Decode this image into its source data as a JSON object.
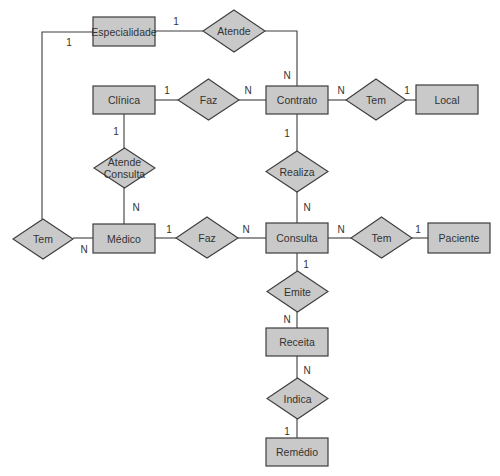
{
  "diagram": {
    "type": "entity-relationship",
    "colors": {
      "fill": "#c9c9c9",
      "stroke": "#3c3c3c",
      "text": "#333333",
      "background": "#ffffff"
    },
    "entities": [
      {
        "id": "especialidade",
        "label": "Especialidade"
      },
      {
        "id": "clinica",
        "label": "Clínica"
      },
      {
        "id": "contrato",
        "label": "Contrato"
      },
      {
        "id": "local",
        "label": "Local"
      },
      {
        "id": "medico",
        "label": "Médico"
      },
      {
        "id": "consulta",
        "label": "Consulta"
      },
      {
        "id": "paciente",
        "label": "Paciente"
      },
      {
        "id": "receita",
        "label": "Receita"
      },
      {
        "id": "remedio",
        "label": "Remédio"
      }
    ],
    "relationships": [
      {
        "id": "atende",
        "label": "Atende",
        "lines": [
          "Atende"
        ]
      },
      {
        "id": "faz1",
        "label": "Faz",
        "lines": [
          "Faz"
        ]
      },
      {
        "id": "tem_local",
        "label": "Tem",
        "lines": [
          "Tem"
        ]
      },
      {
        "id": "atende_consulta",
        "label": "Atende Consulta",
        "lines": [
          "Atende",
          "Consulta"
        ]
      },
      {
        "id": "realiza",
        "label": "Realiza",
        "lines": [
          "Realiza"
        ]
      },
      {
        "id": "tem_esp",
        "label": "Tem",
        "lines": [
          "Tem"
        ]
      },
      {
        "id": "faz2",
        "label": "Faz",
        "lines": [
          "Faz"
        ]
      },
      {
        "id": "tem_paciente",
        "label": "Tem",
        "lines": [
          "Tem"
        ]
      },
      {
        "id": "emite",
        "label": "Emite",
        "lines": [
          "Emite"
        ]
      },
      {
        "id": "indica",
        "label": "Indica",
        "lines": [
          "Indica"
        ]
      }
    ],
    "connections": [
      {
        "from": "especialidade",
        "to": "atende",
        "cardinality": "1"
      },
      {
        "from": "atende",
        "to": "contrato",
        "cardinality": "N"
      },
      {
        "from": "clinica",
        "to": "faz1",
        "cardinality": "1"
      },
      {
        "from": "faz1",
        "to": "contrato",
        "cardinality": "N"
      },
      {
        "from": "contrato",
        "to": "tem_local",
        "cardinality": "N"
      },
      {
        "from": "tem_local",
        "to": "local",
        "cardinality": "1"
      },
      {
        "from": "clinica",
        "to": "atende_consulta",
        "cardinality": "1"
      },
      {
        "from": "atende_consulta",
        "to": "medico",
        "cardinality": "N"
      },
      {
        "from": "contrato",
        "to": "realiza",
        "cardinality": "1"
      },
      {
        "from": "realiza",
        "to": "consulta",
        "cardinality": "N"
      },
      {
        "from": "especialidade",
        "to": "tem_esp",
        "cardinality": "1"
      },
      {
        "from": "tem_esp",
        "to": "medico",
        "cardinality": "N"
      },
      {
        "from": "medico",
        "to": "faz2",
        "cardinality": "1"
      },
      {
        "from": "faz2",
        "to": "consulta",
        "cardinality": "N"
      },
      {
        "from": "consulta",
        "to": "tem_paciente",
        "cardinality": "N"
      },
      {
        "from": "tem_paciente",
        "to": "paciente",
        "cardinality": "1"
      },
      {
        "from": "consulta",
        "to": "emite",
        "cardinality": "1"
      },
      {
        "from": "emite",
        "to": "receita",
        "cardinality": "N"
      },
      {
        "from": "receita",
        "to": "indica",
        "cardinality": "N"
      },
      {
        "from": "indica",
        "to": "remedio",
        "cardinality": "1"
      }
    ]
  }
}
